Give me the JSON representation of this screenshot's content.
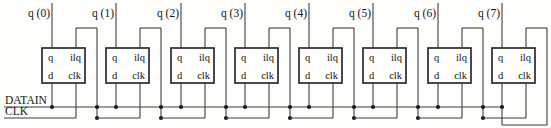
{
  "diagram": {
    "inputs": {
      "datain_label": "DATAIN",
      "clk_label": "CLK"
    },
    "outputs": [
      "q (0)",
      "q (1)",
      "q (2)",
      "q (3)",
      "q (4)",
      "q (5)",
      "q (6)",
      "q (7)"
    ],
    "flipflop_pins": {
      "q": "q",
      "ilq": "ilq",
      "d": "d",
      "clk": "clk"
    },
    "stage_count": 8,
    "colors": {
      "background": "#fdfdfb",
      "wire": "#3f3f3f",
      "box_border": "#2b2b2b",
      "box_fill": "#fefefd",
      "junction_dot": "#1c1c1c",
      "text": "#141414"
    }
  }
}
